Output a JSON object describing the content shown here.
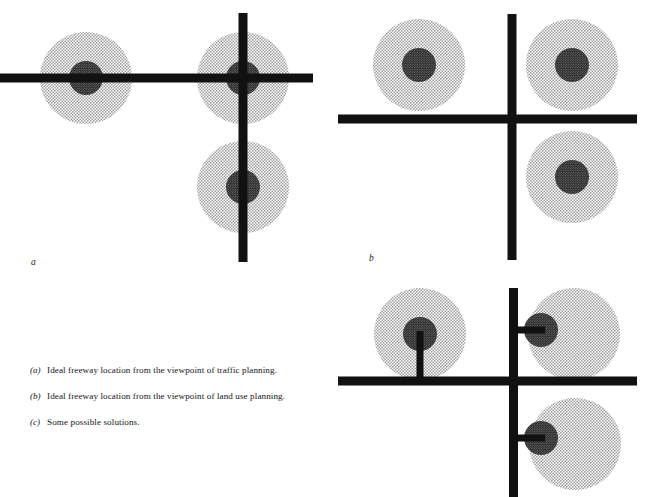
{
  "figure": {
    "background_color": "#ffffff",
    "road_color": "#111111",
    "outer_circle_fill": "#d9d9d9",
    "outer_circle_dot_color": "#8c8c8c",
    "inner_circle_fill": "#4a4a4a",
    "inner_circle_dot_color": "#2b2b2b"
  },
  "panels": [
    {
      "id": "a",
      "label": "a",
      "label_position": {
        "x": 31,
        "y": 262
      },
      "description": "Ideal freeway location from the viewpoint of traffic planning",
      "roads": [
        {
          "name": "horizontal-freeway",
          "orientation": "horizontal",
          "x1": 0,
          "x2": 313,
          "y": 78,
          "thickness": 9
        },
        {
          "name": "vertical-freeway",
          "orientation": "vertical",
          "y1": 13,
          "y2": 262,
          "x": 243,
          "thickness": 9
        }
      ],
      "settlements": [
        {
          "name": "settlement-west",
          "cx": 86,
          "cy": 78,
          "outer_r": 46,
          "inner_r": 17
        },
        {
          "name": "settlement-center",
          "cx": 243,
          "cy": 78,
          "outer_r": 46,
          "inner_r": 17
        },
        {
          "name": "settlement-south",
          "cx": 243,
          "cy": 187,
          "outer_r": 46,
          "inner_r": 17
        }
      ],
      "spurs": []
    },
    {
      "id": "b",
      "label": "b",
      "label_position": {
        "x": 369,
        "y": 258
      },
      "description": "Ideal freeway location from the viewpoint of land use planning",
      "roads": [
        {
          "name": "horizontal-freeway",
          "orientation": "horizontal",
          "x1": 338,
          "x2": 637,
          "y": 119,
          "thickness": 9
        },
        {
          "name": "vertical-freeway",
          "orientation": "vertical",
          "y1": 14,
          "y2": 260,
          "x": 512,
          "thickness": 9
        }
      ],
      "settlements": [
        {
          "name": "settlement-northwest",
          "cx": 419,
          "cy": 65,
          "outer_r": 46,
          "inner_r": 17
        },
        {
          "name": "settlement-northeast",
          "cx": 572,
          "cy": 65,
          "outer_r": 46,
          "inner_r": 17
        },
        {
          "name": "settlement-southeast",
          "cx": 572,
          "cy": 177,
          "outer_r": 46,
          "inner_r": 17
        }
      ],
      "spurs": []
    },
    {
      "id": "c",
      "label": "c",
      "label_position": {
        "x": 369,
        "y": 492
      },
      "description": "Some possible solutions",
      "roads": [
        {
          "name": "horizontal-freeway",
          "orientation": "horizontal",
          "x1": 338,
          "x2": 637,
          "y": 381,
          "thickness": 9
        },
        {
          "name": "vertical-freeway",
          "orientation": "vertical",
          "y1": 288,
          "y2": 497,
          "x": 513,
          "thickness": 9
        }
      ],
      "settlements": [
        {
          "name": "settlement-northwest",
          "cx": 420,
          "cy": 334,
          "outer_r": 46,
          "inner_r": 17
        },
        {
          "name": "settlement-northeast",
          "cx": 574,
          "cy": 334,
          "outer_r": 46,
          "inner_r": 17,
          "inner_cx": 541,
          "inner_cy": 330
        },
        {
          "name": "settlement-southeast",
          "cx": 575,
          "cy": 444,
          "outer_r": 46,
          "inner_r": 17,
          "inner_cx": 541,
          "inner_cy": 438
        }
      ],
      "spurs": [
        {
          "name": "spur-to-northwest",
          "orientation": "vertical",
          "x": 420,
          "y1": 331,
          "y2": 381,
          "thickness": 7
        },
        {
          "name": "spur-to-northeast",
          "orientation": "horizontal",
          "y": 330,
          "x1": 513,
          "x2": 545,
          "thickness": 7
        },
        {
          "name": "spur-to-southeast",
          "orientation": "horizontal",
          "y": 438,
          "x1": 513,
          "x2": 545,
          "thickness": 7
        }
      ]
    }
  ],
  "caption": {
    "items": [
      {
        "marker": "(a)",
        "text": "Ideal freeway location from the viewpoint of traffic planning."
      },
      {
        "marker": "(b)",
        "text": "Ideal freeway location from the viewpoint of land use planning."
      },
      {
        "marker": "(c)",
        "text": "Some possible solutions."
      }
    ]
  }
}
